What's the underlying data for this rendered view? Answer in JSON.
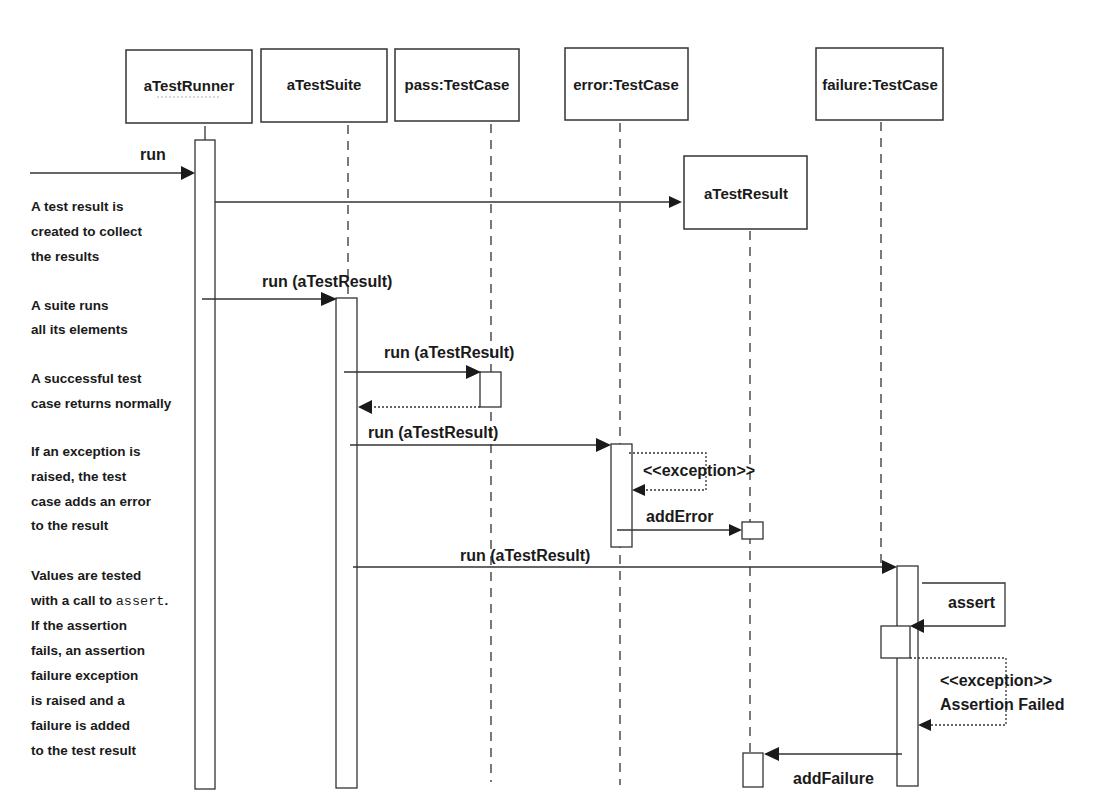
{
  "diagram": {
    "type": "UML sequence diagram",
    "participants": [
      {
        "id": "runner",
        "label": "aTestRunner"
      },
      {
        "id": "suite",
        "label": "aTestSuite"
      },
      {
        "id": "pass",
        "label": "pass:TestCase"
      },
      {
        "id": "error",
        "label": "error:TestCase"
      },
      {
        "id": "result",
        "label": "aTestResult"
      },
      {
        "id": "failure",
        "label": "failure:TestCase"
      }
    ],
    "messages": {
      "run": "run",
      "create_result": "",
      "suite_run": "run (aTestResult)",
      "pass_run": "run (aTestResult)",
      "error_run": "run (aTestResult)",
      "error_exception": "<<exception>>",
      "add_error": "addError",
      "failure_run": "run (aTestResult)",
      "assert": "assert",
      "failure_exception_1": "<<exception>>",
      "failure_exception_2": "Assertion Failed",
      "add_failure": "addFailure"
    },
    "notes": [
      {
        "lines": [
          "A test result is",
          "created to collect",
          "the results"
        ]
      },
      {
        "lines": [
          "A suite runs",
          "all its elements"
        ]
      },
      {
        "lines": [
          "A successful test",
          "case returns normally"
        ]
      },
      {
        "lines": [
          "If an exception is",
          "raised, the test",
          "case adds an error",
          "to the result"
        ]
      },
      {
        "lines": [
          "Values are tested",
          "with a call to ",
          "If the assertion",
          "fails, an assertion",
          "failure exception",
          "is raised and a",
          "failure is added",
          "to the test result"
        ],
        "code": "assert",
        "code_suffix": "."
      }
    ]
  }
}
